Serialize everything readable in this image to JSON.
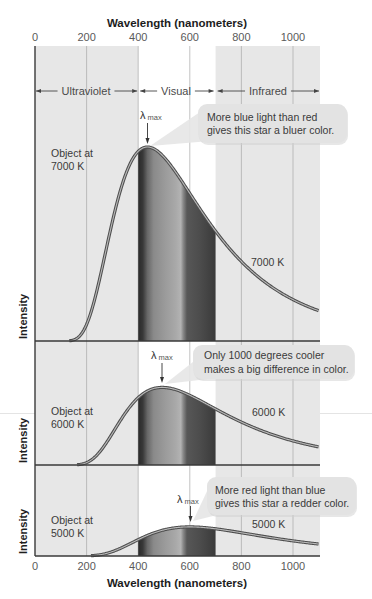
{
  "figure": {
    "top_axis_title": "Wavelength (nanometers)",
    "bottom_axis_title": "Wavelength (nanometers)",
    "y_axis_label": "Intensity",
    "tick_labels": [
      "0",
      "200",
      "400",
      "600",
      "800",
      "1000"
    ],
    "regions": [
      {
        "label": "Ultraviolet"
      },
      {
        "label": "Visual"
      },
      {
        "label": "Infrared"
      }
    ],
    "lambda_max": {
      "symbol": "λ",
      "subscript": "max"
    },
    "panels": [
      {
        "object_label_line1": "Object at",
        "object_label_line2": "7000 K",
        "curve_label": "7000 K",
        "callout_line1": "More blue light than red",
        "callout_line2": "gives this star a bluer color."
      },
      {
        "object_label_line1": "Object at",
        "object_label_line2": "6000 K",
        "curve_label": "6000 K",
        "callout_line1": "Only 1000 degrees cooler",
        "callout_line2": "makes a big difference in color."
      },
      {
        "object_label_line1": "Object at",
        "object_label_line2": "5000 K",
        "curve_label": "5000 K",
        "callout_line1": "More red light than blue",
        "callout_line2": "gives this star a redder color."
      }
    ],
    "colors": {
      "region_shade": "#e7e7e7",
      "visual_region": "#ffffff",
      "curve_outer": "#4e4e4e",
      "curve_inner": "#b9b9b9",
      "callout_fill": "#e3e3e3",
      "axis": "#3a3a3a",
      "grid": "#a9a9a9"
    }
  },
  "chart_data": {
    "type": "line",
    "title": "",
    "xlabel": "Wavelength (nanometers)",
    "ylabel": "Intensity",
    "xlim": [
      0,
      1100
    ],
    "xticks": [
      0,
      200,
      400,
      600,
      800,
      1000
    ],
    "grid": true,
    "legend": "none (curves labeled inline)",
    "layout": "three stacked panels sharing the wavelength axis (top and bottom tick labels)",
    "regions": [
      {
        "label": "Ultraviolet",
        "from": 0,
        "to": 400
      },
      {
        "label": "Visual",
        "from": 400,
        "to": 700
      },
      {
        "label": "Infrared",
        "from": 700,
        "to": 1100
      }
    ],
    "x": [
      100,
      200,
      300,
      400,
      500,
      600,
      700,
      800,
      900,
      1000,
      1100
    ],
    "series": [
      {
        "name": "7000 K",
        "panel": 0,
        "temperature_K": 7000,
        "peak_nm": 436,
        "peak_intensity": 1.0,
        "values": [
          0.0,
          0.086,
          0.617,
          0.977,
          0.948,
          0.76,
          0.566,
          0.41,
          0.294,
          0.215,
          0.157
        ]
      },
      {
        "name": "6000 K",
        "panel": 1,
        "temperature_K": 6000,
        "peak_nm": 493,
        "peak_intensity": 0.4,
        "values": [
          0.0,
          0.012,
          0.162,
          0.346,
          0.399,
          0.36,
          0.29,
          0.222,
          0.166,
          0.124,
          0.094
        ]
      },
      {
        "name": "5000 K",
        "panel": 2,
        "temperature_K": 5000,
        "peak_nm": 600,
        "peak_intensity": 0.15,
        "values": [
          0.0,
          0.001,
          0.023,
          0.084,
          0.135,
          0.15,
          0.14,
          0.12,
          0.098,
          0.078,
          0.062
        ]
      }
    ],
    "annotations": [
      {
        "panel": 0,
        "text": "λ max",
        "at_nm": 436
      },
      {
        "panel": 0,
        "text": "More blue light than red gives this star a bluer color."
      },
      {
        "panel": 0,
        "text": "Object at 7000 K"
      },
      {
        "panel": 1,
        "text": "λ max",
        "at_nm": 493
      },
      {
        "panel": 1,
        "text": "Only 1000 degrees cooler makes a big difference in color."
      },
      {
        "panel": 1,
        "text": "Object at 6000 K"
      },
      {
        "panel": 2,
        "text": "λ max",
        "at_nm": 600
      },
      {
        "panel": 2,
        "text": "More red light than blue gives this star a redder color."
      },
      {
        "panel": 2,
        "text": "Object at 5000 K"
      }
    ]
  }
}
